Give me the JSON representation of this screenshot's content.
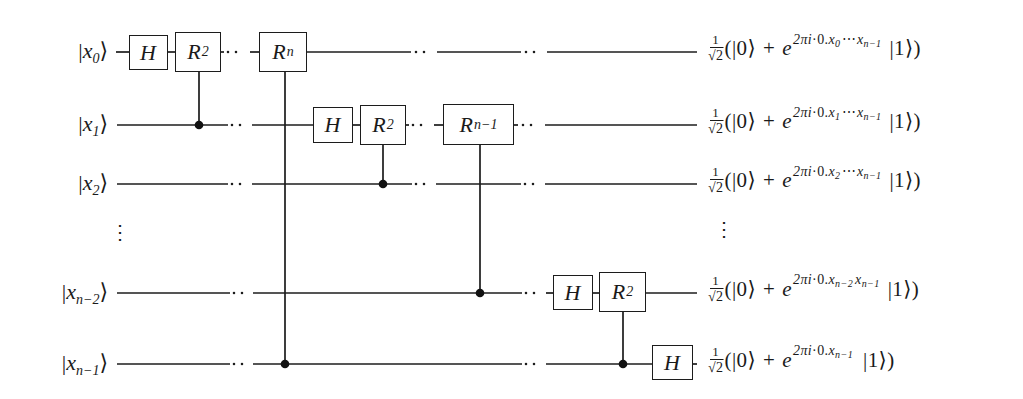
{
  "symbols": {
    "ket_left": "|",
    "ket_right": "⟩",
    "vdots": "⋮"
  },
  "inputs": [
    {
      "var": "x",
      "sub": "0"
    },
    {
      "var": "x",
      "sub": "1"
    },
    {
      "var": "x",
      "sub": "2"
    },
    {
      "var": "x",
      "sub": "n−2"
    },
    {
      "var": "x",
      "sub": "n−1"
    }
  ],
  "gates": [
    {
      "label": "H",
      "sub": "",
      "row": 0
    },
    {
      "label": "R",
      "sub": "2",
      "row": 0,
      "control_row": 1
    },
    {
      "label": "R",
      "sub": "n",
      "row": 0,
      "control_row": 4
    },
    {
      "label": "H",
      "sub": "",
      "row": 1
    },
    {
      "label": "R",
      "sub": "2",
      "row": 1,
      "control_row": 2
    },
    {
      "label": "R",
      "sub": "n−1",
      "row": 1,
      "control_row": 3
    },
    {
      "label": "H",
      "sub": "",
      "row": 3
    },
    {
      "label": "R",
      "sub": "2",
      "row": 3,
      "control_row": 4
    },
    {
      "label": "H",
      "sub": "",
      "row": 4
    }
  ],
  "outputs": [
    {
      "num": "1",
      "radical": "√",
      "radicand": "2",
      "open": "(|0⟩",
      "op": "+",
      "base": "e",
      "exp_coeff": "2πi",
      "exp_dot": "·0.",
      "exp_var1": "x",
      "exp_sub1": "0",
      "exp_sep": "⋯",
      "exp_var2": "x",
      "exp_sub2": "n−1",
      "close": "|1⟩)"
    },
    {
      "num": "1",
      "radical": "√",
      "radicand": "2",
      "open": "(|0⟩",
      "op": "+",
      "base": "e",
      "exp_coeff": "2πi",
      "exp_dot": "·0.",
      "exp_var1": "x",
      "exp_sub1": "1",
      "exp_sep": "⋯",
      "exp_var2": "x",
      "exp_sub2": "n−1",
      "close": "|1⟩)"
    },
    {
      "num": "1",
      "radical": "√",
      "radicand": "2",
      "open": "(|0⟩",
      "op": "+",
      "base": "e",
      "exp_coeff": "2πi",
      "exp_dot": "·0.",
      "exp_var1": "x",
      "exp_sub1": "2",
      "exp_sep": "⋯",
      "exp_var2": "x",
      "exp_sub2": "n−1",
      "close": "|1⟩)"
    },
    {
      "num": "1",
      "radical": "√",
      "radicand": "2",
      "open": "(|0⟩",
      "op": "+",
      "base": "e",
      "exp_coeff": "2πi",
      "exp_dot": "·0.",
      "exp_var1": "x",
      "exp_sub1": "n−2",
      "exp_sep": "",
      "exp_var2": "x",
      "exp_sub2": "n−1",
      "close": "|1⟩)"
    },
    {
      "num": "1",
      "radical": "√",
      "radicand": "2",
      "open": "(|0⟩",
      "op": "+",
      "base": "e",
      "exp_coeff": "2πi",
      "exp_dot": "·0.",
      "exp_var1": "x",
      "exp_sub1": "n−1",
      "exp_sep": "",
      "exp_var2": "",
      "exp_sub2": "",
      "close": "|1⟩)"
    }
  ]
}
